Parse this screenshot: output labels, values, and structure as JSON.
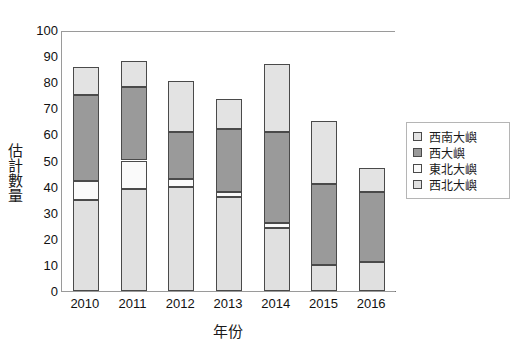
{
  "chart_data": {
    "type": "bar",
    "subtype": "stacked-bar",
    "title": "",
    "xlabel": "年份",
    "ylabel": "估計數量",
    "categories": [
      "2010",
      "2011",
      "2012",
      "2013",
      "2014",
      "2015",
      "2016"
    ],
    "ylim": [
      0,
      100
    ],
    "ytick_values": [
      0,
      10,
      20,
      30,
      40,
      50,
      60,
      70,
      80,
      90,
      100
    ],
    "ytick_labels": [
      "0",
      "10",
      "20",
      "30",
      "40",
      "50",
      "60",
      "70",
      "80",
      "90",
      "100"
    ],
    "grid": false,
    "legend_position": "right",
    "stack_order_bottom_to_top": [
      "西北大嶼",
      "東北大嶼",
      "西大嶼",
      "西南大嶼"
    ],
    "series": [
      {
        "name": "西南大嶼",
        "color": "#e3e3e3",
        "values": [
          11,
          10,
          19.5,
          11.5,
          26,
          24,
          9
        ]
      },
      {
        "name": "西大嶼",
        "color": "#9a9a9a",
        "values": [
          33,
          28,
          18,
          24,
          35,
          31,
          27
        ]
      },
      {
        "name": "東北大嶼",
        "color": "#fafafa",
        "values": [
          7,
          11,
          3,
          2,
          2,
          0,
          0
        ]
      },
      {
        "name": "西北大嶼",
        "color": "#e0e0e0",
        "values": [
          35,
          39,
          40,
          36,
          24,
          10,
          11
        ]
      }
    ],
    "totals": [
      86,
      88,
      80.5,
      73.5,
      87,
      65,
      47
    ]
  },
  "legend": {
    "entries": [
      {
        "label": "西南大嶼",
        "color": "#e3e3e3"
      },
      {
        "label": "西大嶼",
        "color": "#9a9a9a"
      },
      {
        "label": "東北大嶼",
        "color": "#fafafa"
      },
      {
        "label": "西北大嶼",
        "color": "#e0e0e0"
      }
    ]
  },
  "axes": {
    "y_title": "估計數量",
    "x_title": "年份"
  }
}
